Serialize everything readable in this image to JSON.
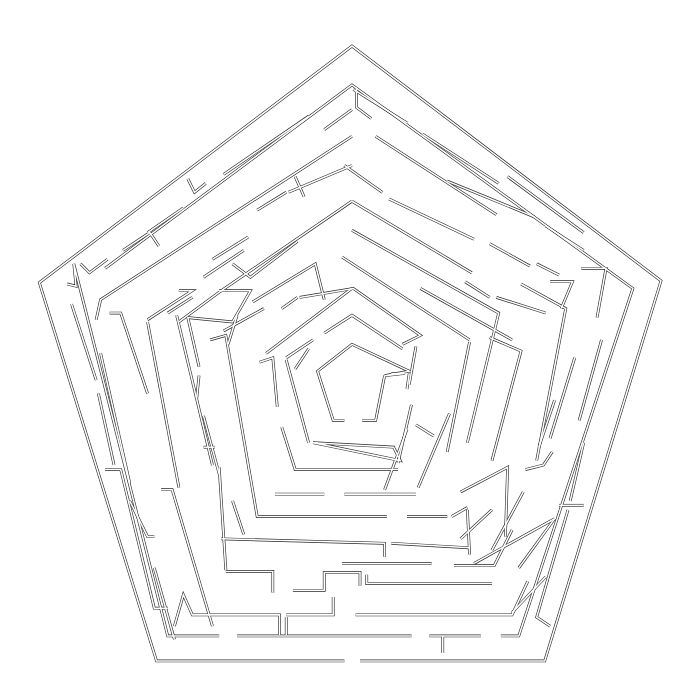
{
  "colors": {
    "wall": "#2a2a2a",
    "background": "#ffffff"
  },
  "maze": {
    "shape": "pentagon",
    "rings": 8,
    "entrance": "bottom edge gap",
    "goal": "center pentagon"
  }
}
